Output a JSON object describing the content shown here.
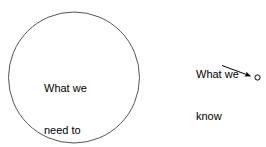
{
  "diagram": {
    "background_color": "#ffffff",
    "stroke_color": "#555555",
    "text_color": "#000000",
    "shapes": {
      "big_circle": {
        "name": "unknown-circle",
        "cx": 74,
        "cy": 77,
        "r": 65,
        "fill": "none",
        "stroke": "#555555",
        "stroke_width": 1,
        "label_lines": [
          "What we",
          "need to",
          "know"
        ]
      },
      "small_circle": {
        "name": "known-dot",
        "cx": 257,
        "cy": 77,
        "r": 2.6,
        "fill": "none",
        "stroke": "#000000",
        "stroke_width": 1
      },
      "arrow": {
        "name": "pointer-arrow",
        "x1": 222,
        "y1": 65,
        "x2": 251,
        "y2": 76,
        "stroke": "#000000",
        "stroke_width": 1,
        "head": "filled-triangle"
      }
    },
    "labels": {
      "unknown": {
        "line1": "What we",
        "line2": "need to",
        "line3": "know"
      },
      "known": {
        "line1": "What we",
        "line2": "know"
      }
    }
  }
}
